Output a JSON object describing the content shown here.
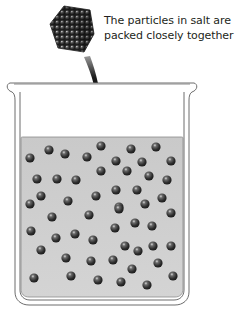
{
  "caption": {
    "line1": "The particles in salt are",
    "line2": "packed closely together"
  },
  "diagram": {
    "crystal_label": "salt-crystal",
    "arrow_direction": "down into beaker",
    "colors": {
      "liquid": "#cfcfcf",
      "particle": "#3a3a3a",
      "particle_highlight": "#bdbdbd",
      "beaker_outline": "#6d6d6d",
      "arrow": "#111111",
      "text": "#231f20"
    },
    "particles": [
      [
        30,
        158
      ],
      [
        49,
        150
      ],
      [
        65,
        154
      ],
      [
        87,
        157
      ],
      [
        101,
        146
      ],
      [
        116,
        161
      ],
      [
        131,
        149
      ],
      [
        142,
        162
      ],
      [
        156,
        147
      ],
      [
        171,
        161
      ],
      [
        37,
        179
      ],
      [
        57,
        179
      ],
      [
        76,
        180
      ],
      [
        101,
        171
      ],
      [
        127,
        171
      ],
      [
        149,
        176
      ],
      [
        167,
        180
      ],
      [
        41,
        196
      ],
      [
        30,
        204
      ],
      [
        68,
        201
      ],
      [
        96,
        196
      ],
      [
        116,
        190
      ],
      [
        137,
        190
      ],
      [
        145,
        204
      ],
      [
        162,
        198
      ],
      [
        119,
        207
      ],
      [
        52,
        217
      ],
      [
        89,
        215
      ],
      [
        119,
        209
      ],
      [
        171,
        213
      ],
      [
        31,
        231
      ],
      [
        115,
        228
      ],
      [
        135,
        223
      ],
      [
        152,
        226
      ],
      [
        56,
        238
      ],
      [
        75,
        234
      ],
      [
        93,
        240
      ],
      [
        41,
        250
      ],
      [
        125,
        246
      ],
      [
        138,
        251
      ],
      [
        153,
        246
      ],
      [
        171,
        246
      ],
      [
        66,
        258
      ],
      [
        91,
        261
      ],
      [
        113,
        260
      ],
      [
        158,
        263
      ],
      [
        132,
        269
      ],
      [
        34,
        278
      ],
      [
        71,
        276
      ],
      [
        98,
        280
      ],
      [
        121,
        282
      ],
      [
        147,
        285
      ],
      [
        173,
        276
      ]
    ]
  }
}
